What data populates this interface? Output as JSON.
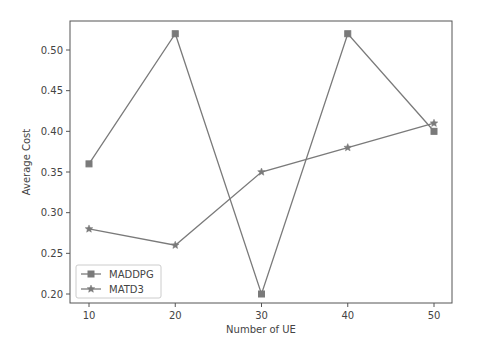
{
  "chart_data": {
    "type": "line",
    "title": "",
    "xlabel": "Number of UE",
    "ylabel": "Average Cost",
    "x": [
      10,
      20,
      30,
      40,
      50
    ],
    "xticks": [
      10,
      20,
      30,
      40,
      50
    ],
    "yticks": [
      0.2,
      0.25,
      0.3,
      0.35,
      0.4,
      0.45,
      0.5
    ],
    "ytick_labels": [
      "0.20",
      "0.25",
      "0.30",
      "0.35",
      "0.40",
      "0.45",
      "0.50"
    ],
    "xlim": [
      8,
      52
    ],
    "ylim": [
      0.185,
      0.535
    ],
    "grid": false,
    "legend_position": "lower left",
    "series": [
      {
        "name": "MADDPG",
        "marker": "square",
        "color": "#7a7a7a",
        "values": [
          0.36,
          0.52,
          0.2,
          0.52,
          0.4
        ]
      },
      {
        "name": "MATD3",
        "marker": "star",
        "color": "#7a7a7a",
        "values": [
          0.28,
          0.26,
          0.35,
          0.38,
          0.41
        ]
      }
    ]
  },
  "colors": {
    "axis": "#555555",
    "text": "#444444",
    "line": "#7a7a7a",
    "legend_border": "#cccccc"
  }
}
